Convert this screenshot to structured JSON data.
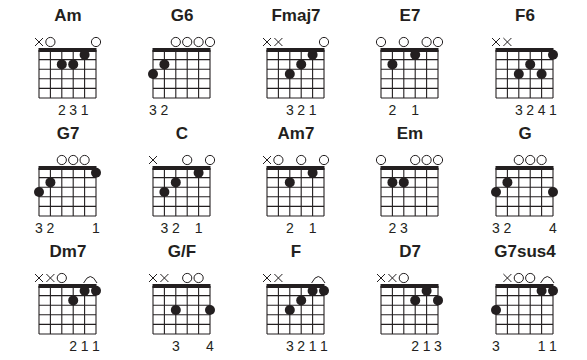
{
  "layout": {
    "col_x": [
      39,
      153,
      267,
      381,
      496
    ],
    "row_nut_y": [
      50,
      168,
      286
    ],
    "string_gap": 11.4,
    "fret_gap": 9.6,
    "frets": 5
  },
  "colors": {
    "ink": "#231f20",
    "background": "#ffffff"
  },
  "chords": [
    {
      "name": "Am",
      "strings": [
        "x",
        "o",
        "",
        "",
        "",
        "o"
      ],
      "dots": [
        [
          2,
          2
        ],
        [
          3,
          2
        ],
        [
          4,
          1
        ]
      ],
      "barre": null,
      "fingers": [
        "",
        "",
        "2",
        "3",
        "1",
        ""
      ]
    },
    {
      "name": "G6",
      "strings": [
        "",
        "",
        "o",
        "o",
        "o",
        "o"
      ],
      "dots": [
        [
          0,
          3
        ],
        [
          1,
          2
        ]
      ],
      "barre": null,
      "fingers": [
        "3",
        "2",
        "",
        "",
        "",
        ""
      ]
    },
    {
      "name": "Fmaj7",
      "strings": [
        "x",
        "x",
        "",
        "",
        "",
        "o"
      ],
      "dots": [
        [
          2,
          3
        ],
        [
          3,
          2
        ],
        [
          4,
          1
        ]
      ],
      "barre": null,
      "fingers": [
        "",
        "",
        "3",
        "2",
        "1",
        ""
      ]
    },
    {
      "name": "E7",
      "strings": [
        "o",
        "",
        "o",
        "",
        "o",
        "o"
      ],
      "dots": [
        [
          1,
          2
        ],
        [
          3,
          1
        ]
      ],
      "barre": null,
      "fingers": [
        "",
        "2",
        "",
        "1",
        "",
        ""
      ]
    },
    {
      "name": "F6",
      "strings": [
        "x",
        "x",
        "",
        "",
        "",
        ""
      ],
      "dots": [
        [
          2,
          3
        ],
        [
          3,
          2
        ],
        [
          4,
          3
        ],
        [
          5,
          1
        ]
      ],
      "barre": null,
      "fingers": [
        "",
        "",
        "3",
        "2",
        "4",
        "1"
      ]
    },
    {
      "name": "G7",
      "strings": [
        "",
        "",
        "o",
        "o",
        "o",
        ""
      ],
      "dots": [
        [
          0,
          3
        ],
        [
          1,
          2
        ],
        [
          5,
          1
        ]
      ],
      "barre": null,
      "fingers": [
        "3",
        "2",
        "",
        "",
        "",
        "1"
      ]
    },
    {
      "name": "C",
      "strings": [
        "x",
        "",
        "",
        "o",
        "",
        "o"
      ],
      "dots": [
        [
          1,
          3
        ],
        [
          2,
          2
        ],
        [
          4,
          1
        ]
      ],
      "barre": null,
      "fingers": [
        "",
        "3",
        "2",
        "",
        "1",
        ""
      ]
    },
    {
      "name": "Am7",
      "strings": [
        "x",
        "o",
        "",
        "o",
        "",
        "o"
      ],
      "dots": [
        [
          2,
          2
        ],
        [
          4,
          1
        ]
      ],
      "barre": null,
      "fingers": [
        "",
        "",
        "2",
        "",
        "1",
        ""
      ]
    },
    {
      "name": "Em",
      "strings": [
        "o",
        "",
        "",
        "o",
        "o",
        "o"
      ],
      "dots": [
        [
          1,
          2
        ],
        [
          2,
          2
        ]
      ],
      "barre": null,
      "fingers": [
        "",
        "2",
        "3",
        "",
        "",
        ""
      ]
    },
    {
      "name": "G",
      "strings": [
        "",
        "",
        "o",
        "o",
        "o",
        ""
      ],
      "dots": [
        [
          0,
          3
        ],
        [
          1,
          2
        ],
        [
          5,
          3
        ]
      ],
      "barre": null,
      "fingers": [
        "3",
        "2",
        "",
        "",
        "",
        "4"
      ]
    },
    {
      "name": "Dm7",
      "strings": [
        "x",
        "x",
        "o",
        "",
        "",
        ""
      ],
      "dots": [
        [
          3,
          2
        ],
        [
          4,
          1
        ],
        [
          5,
          1
        ]
      ],
      "barre": [
        4,
        5
      ],
      "fingers": [
        "",
        "",
        "",
        "2",
        "1",
        "1"
      ]
    },
    {
      "name": "G/F",
      "strings": [
        "x",
        "x",
        "",
        "o",
        "o",
        ""
      ],
      "dots": [
        [
          2,
          3
        ],
        [
          5,
          3
        ]
      ],
      "barre": null,
      "fingers": [
        "",
        "",
        "3",
        "",
        "",
        "4"
      ]
    },
    {
      "name": "F",
      "strings": [
        "x",
        "x",
        "",
        "",
        "",
        ""
      ],
      "dots": [
        [
          2,
          3
        ],
        [
          3,
          2
        ],
        [
          4,
          1
        ],
        [
          5,
          1
        ]
      ],
      "barre": [
        4,
        5
      ],
      "fingers": [
        "",
        "",
        "3",
        "2",
        "1",
        "1"
      ]
    },
    {
      "name": "D7",
      "strings": [
        "x",
        "x",
        "o",
        "",
        "",
        ""
      ],
      "dots": [
        [
          3,
          2
        ],
        [
          4,
          1
        ],
        [
          5,
          2
        ]
      ],
      "barre": null,
      "fingers": [
        "",
        "",
        "",
        "2",
        "1",
        "3"
      ]
    },
    {
      "name": "G7sus4",
      "strings": [
        "",
        "x",
        "o",
        "o",
        "",
        ""
      ],
      "dots": [
        [
          0,
          3
        ],
        [
          4,
          1
        ],
        [
          5,
          1
        ]
      ],
      "barre": [
        4,
        5
      ],
      "fingers": [
        "3",
        "",
        "",
        "",
        "1",
        "1"
      ]
    }
  ]
}
